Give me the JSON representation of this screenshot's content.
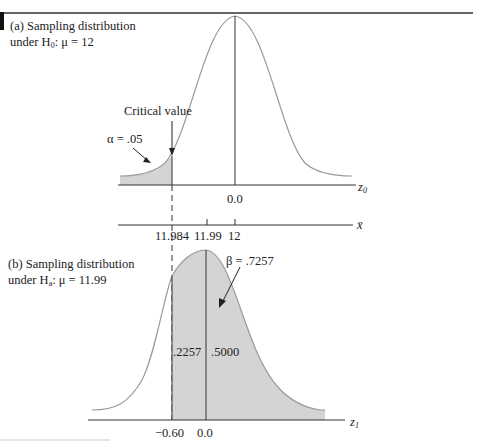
{
  "panel_a": {
    "caption_line1": "(a) Sampling distribution",
    "caption_line2_prefix": "under H",
    "caption_line2_sub": "0",
    "caption_line2_suffix": ": μ = 12",
    "critical_value_label": "Critical value",
    "alpha_label": "α = .05",
    "z_axis_tick": "0.0",
    "z_axis_label": "z",
    "z_axis_label_sub": "0",
    "xbar_axis_label": "x̄",
    "xbar_ticks": [
      "11.984",
      "11.99",
      "12"
    ]
  },
  "panel_b": {
    "caption_line1": "(b) Sampling distribution",
    "caption_line2_prefix": "under H",
    "caption_line2_sub": "a",
    "caption_line2_suffix": ": μ = 11.99",
    "beta_label": "β = .7257",
    "area_left": ".2257",
    "area_right": ".5000",
    "z_ticks": [
      "−0.60",
      "0.0"
    ],
    "z_axis_label": "z",
    "z_axis_label_sub": "1"
  },
  "colors": {
    "shade": "#d4d4d4",
    "curve": "#9a9a9a",
    "axis": "#333333"
  }
}
